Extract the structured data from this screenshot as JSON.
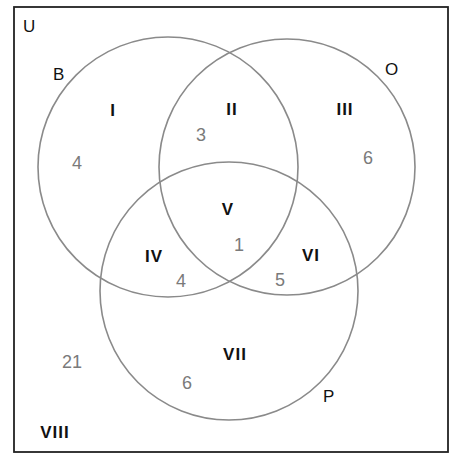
{
  "universe_label": "U",
  "sets": [
    {
      "label": "B",
      "cx": 168,
      "cy": 167,
      "r": 130
    },
    {
      "label": "O",
      "cx": 287,
      "cy": 167,
      "r": 128
    },
    {
      "label": "P",
      "cx": 229,
      "cy": 291,
      "r": 129
    }
  ],
  "regions": [
    {
      "id": "I",
      "count": "4"
    },
    {
      "id": "II",
      "count": "3"
    },
    {
      "id": "III",
      "count": "6"
    },
    {
      "id": "IV",
      "count": "4"
    },
    {
      "id": "V",
      "count": "1"
    },
    {
      "id": "VI",
      "count": "5"
    },
    {
      "id": "VII",
      "count": "6"
    },
    {
      "id": "VIII",
      "count": "21"
    }
  ],
  "colors": {
    "frame": "#222222",
    "circle": "#8a8a8a",
    "count": "#7a7a7a",
    "label": "#111111"
  }
}
